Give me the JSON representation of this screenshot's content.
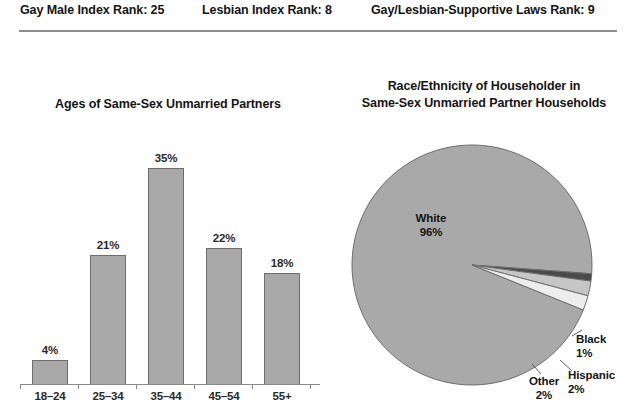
{
  "header": {
    "items": [
      {
        "label": "Gay Male Index Rank: 25"
      },
      {
        "label": "Lesbian Index Rank: 8"
      },
      {
        "label": "Gay/Lesbian-Supportive Laws Rank: 9"
      }
    ]
  },
  "colors": {
    "fill_gray": "#a9a9a9",
    "stroke_gray": "#6e6e6e",
    "light_gray": "#e3e3e3",
    "dark_gray": "#4a4a4a",
    "rule": "#8d8d8d",
    "text": "#151515",
    "background": "#ffffff"
  },
  "chart_data": [
    {
      "type": "bar",
      "title": "Ages of Same-Sex Unmarried Partners",
      "xlabel": "",
      "ylabel": "",
      "ylim": [
        0,
        38
      ],
      "grid": false,
      "legend": "none",
      "categories": [
        "18–24",
        "25–34",
        "35–44",
        "45–54",
        "55+"
      ],
      "values": [
        4,
        21,
        35,
        22,
        18
      ],
      "value_labels": [
        "4%",
        "21%",
        "35%",
        "22%",
        "18%"
      ]
    },
    {
      "type": "pie",
      "title": "Race/Ethnicity of Householder in Same-Sex Unmarried Partner Households",
      "title_line1": "Race/Ethnicity of Householder in",
      "title_line2": "Same-Sex Unmarried Partner Households",
      "legend": "none",
      "labels": [
        "White",
        "Black",
        "Hispanic",
        "Other"
      ],
      "values": [
        96,
        1,
        2,
        2
      ],
      "value_labels": [
        "96%",
        "1%",
        "2%",
        "2%"
      ],
      "slice_colors": [
        "#a9a9a9",
        "#4a4a4a",
        "#c6c6c6",
        "#ededed"
      ]
    }
  ]
}
